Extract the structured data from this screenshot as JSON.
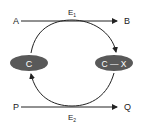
{
  "diagram": {
    "top": {
      "from": "A",
      "to": "B",
      "enzyme": "E",
      "enzyme_sub": "1"
    },
    "bottom": {
      "from": "P",
      "to": "Q",
      "enzyme": "E",
      "enzyme_sub": "2"
    },
    "left_node": {
      "label": "C"
    },
    "right_node": {
      "label": "C — X"
    },
    "colors": {
      "node_fill": "#595959",
      "node_text": "#ffffff",
      "line": "#222222"
    }
  }
}
